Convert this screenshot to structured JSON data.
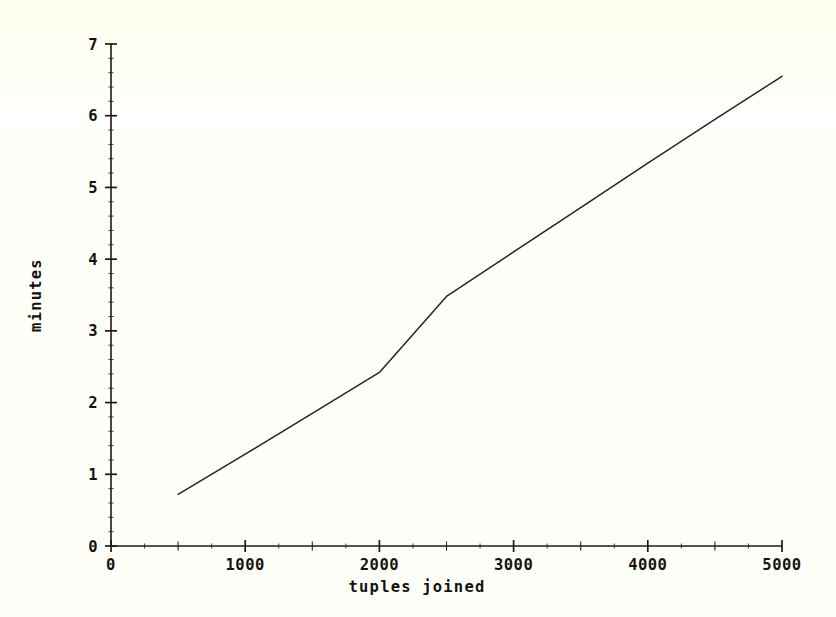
{
  "chart_data": {
    "type": "line",
    "title": "",
    "subtitle": "",
    "xlabel": "tuples joined",
    "ylabel": "minutes",
    "xlim": [
      0,
      5000
    ],
    "ylim": [
      0,
      7
    ],
    "grid": false,
    "legend": null,
    "x_ticks": [
      0,
      1000,
      2000,
      3000,
      4000,
      5000
    ],
    "x_tick_labels": [
      "0",
      "1000",
      "2000",
      "3000",
      "4000",
      "5000"
    ],
    "x_minor_step": 250,
    "y_ticks": [
      0,
      1,
      2,
      3,
      4,
      5,
      6,
      7
    ],
    "y_tick_labels": [
      "0",
      "1",
      "2",
      "3",
      "4",
      "5",
      "6",
      "7"
    ],
    "y_minor_step": 0.2,
    "series": [
      {
        "name": "join time",
        "x": [
          500,
          1000,
          1500,
          2000,
          2500,
          3000,
          3500,
          4000,
          4500,
          5000
        ],
        "y": [
          0.72,
          1.28,
          1.85,
          2.42,
          3.48,
          4.1,
          4.72,
          5.34,
          5.95,
          6.55
        ]
      }
    ],
    "annotations": []
  },
  "axes": {
    "x_axis_name": "x-axis",
    "y_axis_name": "y-axis"
  }
}
